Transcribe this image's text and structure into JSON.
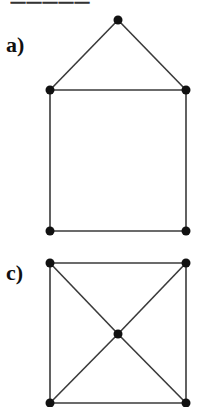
{
  "header": {
    "partial_title": "一一一一一"
  },
  "diagrams": [
    {
      "label": "a)",
      "type": "graph",
      "nodes": [
        {
          "id": "apex",
          "x": 118,
          "y": 20
        },
        {
          "id": "tl",
          "x": 50,
          "y": 90
        },
        {
          "id": "tr",
          "x": 186,
          "y": 90
        },
        {
          "id": "bl",
          "x": 50,
          "y": 231
        },
        {
          "id": "br",
          "x": 186,
          "y": 231
        }
      ],
      "edges": [
        [
          "apex",
          "tl"
        ],
        [
          "apex",
          "tr"
        ],
        [
          "tl",
          "tr"
        ],
        [
          "tl",
          "bl"
        ],
        [
          "tr",
          "br"
        ],
        [
          "bl",
          "br"
        ]
      ]
    },
    {
      "label": "c)",
      "type": "graph",
      "nodes": [
        {
          "id": "tl",
          "x": 50,
          "y": 263
        },
        {
          "id": "tr",
          "x": 186,
          "y": 263
        },
        {
          "id": "center",
          "x": 118,
          "y": 334
        },
        {
          "id": "bl",
          "x": 50,
          "y": 403
        },
        {
          "id": "br",
          "x": 186,
          "y": 403
        }
      ],
      "edges": [
        [
          "tl",
          "tr"
        ],
        [
          "tl",
          "bl"
        ],
        [
          "tr",
          "br"
        ],
        [
          "bl",
          "br"
        ],
        [
          "tl",
          "center"
        ],
        [
          "tr",
          "center"
        ],
        [
          "bl",
          "center"
        ],
        [
          "br",
          "center"
        ]
      ]
    }
  ],
  "colors": {
    "edge": "#3a3a3a",
    "node": "#111111",
    "background": "#ffffff"
  }
}
